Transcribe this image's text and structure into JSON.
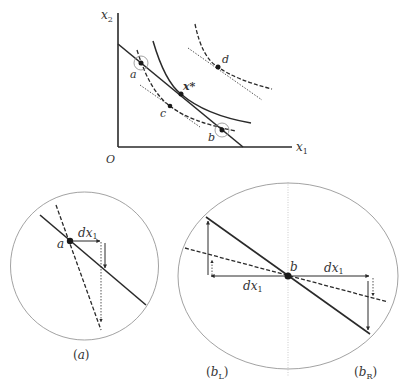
{
  "top_figure": {
    "axis_labels": {
      "y": "x",
      "y_sub": "2",
      "x": "x",
      "x_sub": "1",
      "origin": "O"
    },
    "points": {
      "a": "a",
      "b": "b",
      "c": "c",
      "d": "d",
      "x_star": "x*"
    }
  },
  "panel_a": {
    "point_label": "a",
    "dx_label": "dx",
    "dx_sub": "1",
    "caption_open": "(",
    "caption_var": "a",
    "caption_close": ")"
  },
  "panel_b": {
    "point_label": "b",
    "dx_left": "dx",
    "dx_left_sub": "1",
    "dx_right": "dx",
    "dx_right_sub": "1",
    "caption_left": "(b",
    "caption_left_sub": "L",
    "caption_right": "(b",
    "caption_right_sub": "R",
    "caption_close": ")"
  },
  "colors": {
    "ink": "#2a2a2a",
    "circle": "#8a8a8a",
    "guide": "#bdbdbd"
  }
}
